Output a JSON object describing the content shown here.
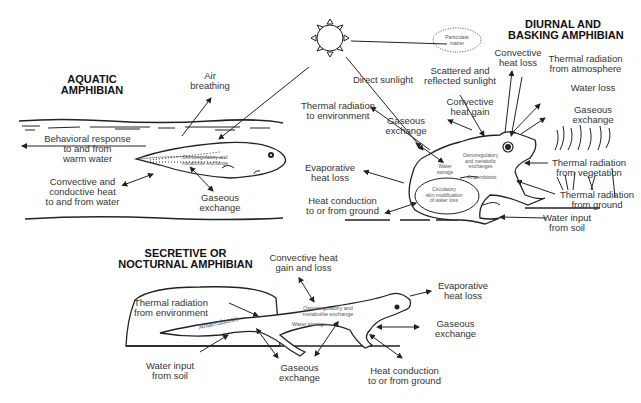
{
  "aquatic": {
    "title": [
      "AQUATIC",
      "AMPHIBIAN"
    ],
    "labels": {
      "air_breathing": [
        "Air",
        "breathing"
      ],
      "behavioral": [
        "Behavioral response",
        "to and from",
        "warm water"
      ],
      "convective": [
        "Convective and",
        "conductive heat",
        "to and from water"
      ],
      "gaseous": [
        "Gaseous",
        "exchange"
      ],
      "internal": [
        "Osmoregulatory and",
        "metabolite exchange"
      ]
    }
  },
  "diurnal": {
    "title": [
      "DIURNAL AND",
      "BASKING AMPHIBIAN"
    ],
    "labels": {
      "particulate": [
        "Particulate",
        "matter"
      ],
      "direct_sunlight": "Direct sunlight",
      "scattered": [
        "Scattered and",
        "reflected sunlight"
      ],
      "convective_loss": [
        "Convective",
        "heat loss"
      ],
      "thermal_atmosphere": [
        "Thermal radiation",
        "from atmosphere"
      ],
      "thermal_environment": [
        "Thermal radiation",
        "to environment"
      ],
      "convective_gain": [
        "Convective",
        "heat gain"
      ],
      "water_loss": "Water loss",
      "gaseous_right": [
        "Gaseous",
        "exchange"
      ],
      "gaseous_left": [
        "Gaseous",
        "exchange"
      ],
      "evaporative": [
        "Evaporative",
        "heat loss"
      ],
      "thermal_vegetation": [
        "Thermal radiation",
        "from vegetation"
      ],
      "thermal_ground": [
        "Thermal radiation",
        "from ground"
      ],
      "heat_conduction": [
        "Heat conduction",
        "to or from ground"
      ],
      "water_input": [
        "Water input",
        "from soil"
      ],
      "internal_water": [
        "Water",
        "storage"
      ],
      "internal_osmo": [
        "Osmoregulatory",
        "and metabolic",
        "exchanges"
      ],
      "internal_anaerobiosis": "Anaerobiosis",
      "internal_circulatory": [
        "Circulatory",
        "skin modification",
        "of water loss"
      ]
    }
  },
  "secretive": {
    "title": [
      "SECRETIVE OR",
      "NOCTURNAL AMPHIBIAN"
    ],
    "labels": {
      "convective": [
        "Convective heat",
        "gain and loss"
      ],
      "thermal_env": [
        "Thermal radiation",
        "from environment"
      ],
      "anaerobiosis": "Anaerobiosis",
      "internal_osmo": [
        "Osmoregulatory and",
        "metabolite exchange"
      ],
      "water_storage": "Water storage",
      "evaporative": [
        "Evaporative",
        "heat loss"
      ],
      "gaseous_right": [
        "Gaseous",
        "exchange"
      ],
      "water_input": [
        "Water input",
        "from soil"
      ],
      "gaseous_bottom": [
        "Gaseous",
        "exchange"
      ],
      "heat_conduction": [
        "Heat conduction",
        "to or from ground"
      ]
    }
  }
}
